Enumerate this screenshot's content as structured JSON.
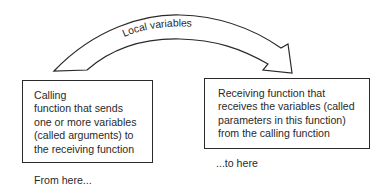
{
  "arrow": {
    "label": "Local variables",
    "direction": "left-to-right"
  },
  "source_box": {
    "lines": [
      "Calling",
      "function that sends",
      "one or more variables",
      "(called arguments) to",
      "the receiving function"
    ],
    "caption": "From here..."
  },
  "target_box": {
    "lines": [
      "Receiving function that",
      "receives the variables (called",
      "parameters in this function)",
      "from the calling function"
    ],
    "caption": "...to here"
  }
}
